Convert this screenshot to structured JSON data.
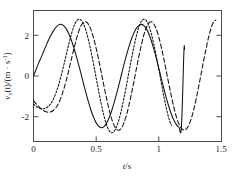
{
  "figure": {
    "background_color": "#ffffff",
    "line_color": "#111111",
    "frame_color": "#4a4a4a"
  },
  "axes": {
    "x_title_symbol": "t",
    "x_title_unit": "/s",
    "y_title_prefix": "v",
    "y_title_sub": "x",
    "y_title_mid": "(t)/(m · s",
    "y_title_sup": "-1",
    "y_title_suffix": ")",
    "x_tick_labels": [
      "0",
      "0.5",
      "1",
      "1.5"
    ],
    "y_tick_labels": [
      "2",
      "0",
      "-2"
    ]
  },
  "chart_data": {
    "type": "line",
    "title": "",
    "xlabel": "t/s",
    "ylabel": "v_x(t)/(m · s^-1)",
    "xlim": [
      0,
      1.5
    ],
    "ylim": [
      -2.6,
      2.6
    ],
    "xticks": [
      0,
      0.5,
      1,
      1.5
    ],
    "yticks": [
      -2,
      0,
      2
    ],
    "grid": false,
    "legend": "none",
    "series": [
      {
        "name": "solid",
        "style": "solid",
        "color": "#111111",
        "amplitude": 2.05,
        "period": 0.338,
        "phase_rad": 0.0,
        "t_start": 0.0,
        "t_end": 1.205,
        "x": [
          0.0,
          0.02,
          0.04,
          0.06,
          0.08,
          0.1,
          0.12,
          0.14,
          0.16,
          0.18,
          0.2,
          0.22,
          0.24,
          0.26,
          0.28,
          0.3,
          0.32,
          0.34,
          0.36,
          0.38,
          0.4,
          0.42,
          0.44,
          0.46,
          0.48,
          0.5,
          0.52,
          0.54,
          0.56,
          0.58,
          0.6,
          0.62,
          0.64,
          0.66,
          0.68,
          0.7,
          0.72,
          0.74,
          0.76,
          0.78,
          0.8,
          0.82,
          0.84,
          0.86,
          0.88,
          0.9,
          0.92,
          0.94,
          0.96,
          0.98,
          1.0,
          1.02,
          1.04,
          1.06,
          1.08,
          1.1,
          1.12,
          1.14,
          1.16,
          1.18,
          1.2,
          1.205
        ],
        "y": [
          0.0,
          0.25,
          0.5,
          0.73,
          0.96,
          1.2,
          1.43,
          1.63,
          1.8,
          1.94,
          2.03,
          2.05,
          2.0,
          1.88,
          1.7,
          1.45,
          1.15,
          0.82,
          0.45,
          0.07,
          -0.32,
          -0.7,
          -1.06,
          -1.38,
          -1.65,
          -1.86,
          -1.99,
          -2.05,
          -2.02,
          -1.9,
          -1.7,
          -1.44,
          -1.12,
          -0.76,
          -0.38,
          0.02,
          0.42,
          0.8,
          1.14,
          1.45,
          1.7,
          1.89,
          2.0,
          2.05,
          2.0,
          1.88,
          1.68,
          1.4,
          1.07,
          0.7,
          0.3,
          -0.1,
          -0.5,
          -0.88,
          -1.22,
          -1.52,
          -1.76,
          -1.93,
          -2.03,
          -2.04,
          0.95,
          1.05
        ]
      },
      {
        "name": "dotted",
        "style": "dotted",
        "color": "#111111",
        "amplitude": 2.25,
        "period": 0.362,
        "phase_rad": -2.05,
        "t_start": 0.0,
        "t_end": 1.105,
        "x": [
          0.0,
          0.02,
          0.04,
          0.06,
          0.08,
          0.1,
          0.12,
          0.14,
          0.16,
          0.18,
          0.2,
          0.22,
          0.24,
          0.26,
          0.28,
          0.3,
          0.32,
          0.34,
          0.36,
          0.38,
          0.4,
          0.42,
          0.44,
          0.46,
          0.48,
          0.5,
          0.52,
          0.54,
          0.56,
          0.58,
          0.6,
          0.62,
          0.64,
          0.66,
          0.68,
          0.7,
          0.72,
          0.74,
          0.76,
          0.78,
          0.8,
          0.82,
          0.84,
          0.86,
          0.88,
          0.9,
          0.92,
          0.94,
          0.96,
          0.98,
          1.0,
          1.02,
          1.04,
          1.06,
          1.08,
          1.1
        ],
        "y": [
          -1.12,
          -1.2,
          -1.26,
          -1.3,
          -1.3,
          -1.27,
          -1.2,
          -1.08,
          -0.9,
          -0.66,
          -0.36,
          0.0,
          0.4,
          0.82,
          1.24,
          1.62,
          1.94,
          2.16,
          2.25,
          2.22,
          2.06,
          1.78,
          1.4,
          0.95,
          0.45,
          -0.08,
          -0.6,
          -1.1,
          -1.54,
          -1.9,
          -2.14,
          -2.25,
          -2.22,
          -2.05,
          -1.76,
          -1.38,
          -0.92,
          -0.42,
          0.12,
          0.64,
          1.13,
          1.57,
          1.93,
          2.16,
          2.25,
          2.2,
          2.0,
          1.68,
          1.26,
          0.78,
          0.26,
          -0.28,
          -0.8,
          -1.28,
          -1.68,
          -1.96
        ]
      },
      {
        "name": "dashed",
        "style": "dashed",
        "color": "#111111",
        "amplitude": 2.15,
        "period": 0.375,
        "phase_rad": -2.35,
        "t_start": 0.0,
        "t_end": 1.455,
        "x": [
          0.0,
          0.02,
          0.04,
          0.06,
          0.08,
          0.1,
          0.12,
          0.14,
          0.16,
          0.18,
          0.2,
          0.22,
          0.24,
          0.26,
          0.28,
          0.3,
          0.32,
          0.34,
          0.36,
          0.38,
          0.4,
          0.42,
          0.44,
          0.46,
          0.48,
          0.5,
          0.52,
          0.54,
          0.56,
          0.58,
          0.6,
          0.62,
          0.64,
          0.66,
          0.68,
          0.7,
          0.72,
          0.74,
          0.76,
          0.78,
          0.8,
          0.82,
          0.84,
          0.86,
          0.88,
          0.9,
          0.92,
          0.94,
          0.96,
          0.98,
          1.0,
          1.02,
          1.04,
          1.06,
          1.08,
          1.1,
          1.12,
          1.14,
          1.16,
          1.18,
          1.2,
          1.22,
          1.24,
          1.26,
          1.28,
          1.3,
          1.32,
          1.34,
          1.36,
          1.38,
          1.4,
          1.42,
          1.44,
          1.455
        ],
        "y": [
          -0.98,
          -1.1,
          -1.2,
          -1.3,
          -1.37,
          -1.42,
          -1.44,
          -1.42,
          -1.36,
          -1.25,
          -1.08,
          -0.85,
          -0.55,
          -0.2,
          0.2,
          0.62,
          1.03,
          1.42,
          1.76,
          2.0,
          2.13,
          2.15,
          2.04,
          1.82,
          1.5,
          1.1,
          0.64,
          0.16,
          -0.34,
          -0.82,
          -1.26,
          -1.64,
          -1.93,
          -2.1,
          -2.15,
          -2.08,
          -1.88,
          -1.58,
          -1.2,
          -0.74,
          -0.25,
          0.26,
          0.76,
          1.22,
          1.62,
          1.92,
          2.1,
          2.15,
          2.07,
          1.86,
          1.54,
          1.14,
          0.68,
          0.18,
          -0.32,
          -0.8,
          -1.25,
          -1.62,
          -1.9,
          -2.08,
          -2.15,
          -2.1,
          -1.94,
          -1.67,
          -1.3,
          -0.86,
          -0.37,
          0.15,
          0.67,
          1.16,
          1.6,
          1.95,
          2.17,
          2.22
        ]
      }
    ]
  }
}
